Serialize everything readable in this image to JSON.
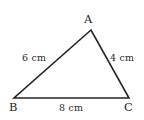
{
  "figure": {
    "type": "geometry-diagram",
    "shape": "triangle",
    "background_color": "#ffffff",
    "stroke_color": "#252525",
    "stroke_width": 1.6,
    "text_color": "#2b2b2b",
    "vertices": [
      {
        "name": "A",
        "label": "A",
        "x": 91,
        "y": 30
      },
      {
        "name": "B",
        "label": "B",
        "x": 14,
        "y": 98
      },
      {
        "name": "C",
        "label": "C",
        "x": 129,
        "y": 98
      }
    ],
    "sides": [
      {
        "name": "AB",
        "label": "6 cm",
        "length": 6,
        "unit": "cm"
      },
      {
        "name": "AC",
        "label": "4 cm",
        "length": 4,
        "unit": "cm"
      },
      {
        "name": "BC",
        "label": "8 cm",
        "length": 8,
        "unit": "cm"
      }
    ]
  }
}
